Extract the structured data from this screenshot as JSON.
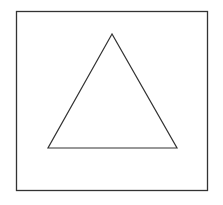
{
  "diagram": {
    "frame": {
      "x": 16.5,
      "y": 11.5,
      "width": 191,
      "height": 179,
      "stroke": "#333333"
    },
    "triangle": {
      "points": "112,34 48,148 177,148",
      "stroke": "#333333",
      "fill": "none"
    }
  }
}
